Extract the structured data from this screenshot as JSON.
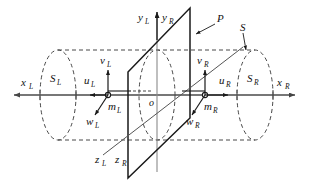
{
  "figure": {
    "background_color": "#ffffff",
    "line_color": "#1a1a1a",
    "axis_color": "#555555",
    "dashed_color": "#333333"
  },
  "labels": {
    "x_left": {
      "base": "x",
      "sub": "L"
    },
    "x_right": {
      "base": "x",
      "sub": "R"
    },
    "y_left": {
      "base": "y",
      "sub": "L"
    },
    "y_right": {
      "base": "y",
      "sub": "R"
    },
    "z_left": {
      "base": "z",
      "sub": "L"
    },
    "z_right": {
      "base": "z",
      "sub": "R"
    },
    "u_left": {
      "base": "u",
      "sub": "L"
    },
    "u_right": {
      "base": "u",
      "sub": "R"
    },
    "v_left": {
      "base": "v",
      "sub": "L"
    },
    "v_right": {
      "base": "v",
      "sub": "R"
    },
    "w_left": {
      "base": "w",
      "sub": "L"
    },
    "w_right": {
      "base": "w",
      "sub": "R"
    },
    "m_left": {
      "base": "m",
      "sub": "L"
    },
    "m_right": {
      "base": "m",
      "sub": "R"
    },
    "s_left": {
      "base": "S",
      "sub": "L"
    },
    "s_right": {
      "base": "S",
      "sub": "R"
    },
    "origin": {
      "base": "o",
      "sub": ""
    },
    "plane_p": {
      "base": "P",
      "sub": ""
    },
    "surface_s": {
      "base": "S",
      "sub": ""
    }
  },
  "geometry": {
    "horizontal_axis_y": 95,
    "vertical_axis_x": 157,
    "origin_point": {
      "x": 157,
      "y": 95
    },
    "left_camera_point": {
      "x": 108,
      "y": 95
    },
    "right_camera_point": {
      "x": 205,
      "y": 95
    },
    "cylinder_top_y": 50,
    "cylinder_bottom_y": 140,
    "left_ellipse_center_x": 58,
    "right_ellipse_center_x": 255,
    "ellipse_rx": 18,
    "ellipse_ry": 45,
    "plane_corners": [
      {
        "x": 128,
        "y": 72
      },
      {
        "x": 190,
        "y": 8
      },
      {
        "x": 190,
        "y": 118
      },
      {
        "x": 128,
        "y": 178
      }
    ]
  }
}
